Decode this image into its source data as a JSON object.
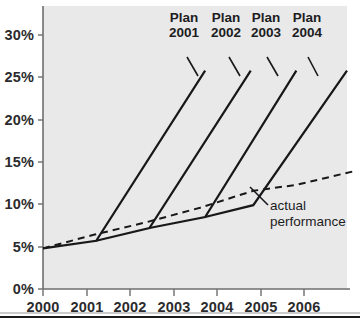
{
  "chart_data": {
    "type": "line",
    "title": "",
    "subtitle": "",
    "xlabel": "",
    "ylabel": "",
    "grid": false,
    "legend_position": "annotation",
    "x": [
      2000,
      2001,
      2002,
      2003,
      2004,
      2005,
      2006
    ],
    "x_tick_labels": [
      "2000",
      "2001",
      "2002",
      "2003",
      "2004",
      "2005",
      "2006"
    ],
    "xlim": [
      2000,
      2006
    ],
    "ylim": [
      0,
      31
    ],
    "y_tick_values": [
      0,
      5,
      10,
      15,
      20,
      25,
      30
    ],
    "y_tick_labels": [
      "0%",
      "5%",
      "10%",
      "15%",
      "20%",
      "25%",
      "30%"
    ],
    "y_unit": "%",
    "series": [
      {
        "name": "actual performance",
        "style": "dashed",
        "color": "#18181a",
        "points": [
          {
            "x": 2000.0,
            "y": 4.8
          },
          {
            "x": 2001.0,
            "y": 6.4
          },
          {
            "x": 2002.05,
            "y": 7.9
          },
          {
            "x": 2003.1,
            "y": 9.6
          },
          {
            "x": 2004.15,
            "y": 11.6
          },
          {
            "x": 2005.0,
            "y": 12.3
          },
          {
            "x": 2006.2,
            "y": 14.0
          }
        ]
      },
      {
        "name": "Plan 2001",
        "style": "solid",
        "color": "#18181a",
        "points": [
          {
            "x": 2000.0,
            "y": 4.8
          },
          {
            "x": 2001.05,
            "y": 5.7
          },
          {
            "x": 2003.2,
            "y": 25.8
          }
        ]
      },
      {
        "name": "Plan 2002",
        "style": "solid",
        "color": "#18181a",
        "points": [
          {
            "x": 2001.05,
            "y": 5.7
          },
          {
            "x": 2002.1,
            "y": 7.2
          },
          {
            "x": 2004.1,
            "y": 25.8
          }
        ]
      },
      {
        "name": "Plan 2003",
        "style": "solid",
        "color": "#18181a",
        "points": [
          {
            "x": 2002.1,
            "y": 7.2
          },
          {
            "x": 2003.2,
            "y": 8.5
          },
          {
            "x": 2005.0,
            "y": 25.8
          }
        ]
      },
      {
        "name": "Plan 2004",
        "style": "solid",
        "color": "#18181a",
        "points": [
          {
            "x": 2003.2,
            "y": 8.5
          },
          {
            "x": 2004.15,
            "y": 9.9
          },
          {
            "x": 2006.0,
            "y": 25.8
          }
        ]
      },
      {
        "name": "actual baseline tail",
        "style": "solid",
        "color": "#18181a",
        "points": [
          {
            "x": 2004.15,
            "y": 9.9
          },
          {
            "x": 2004.2,
            "y": 9.9
          }
        ]
      }
    ],
    "annotations": [
      {
        "id": "plan-2001",
        "text_line1": "Plan",
        "text_line2": "2001",
        "anchor_x": 2003.2,
        "anchor_y": 25.8
      },
      {
        "id": "plan-2002",
        "text_line1": "Plan",
        "text_line2": "2002",
        "anchor_x": 2004.1,
        "anchor_y": 25.8
      },
      {
        "id": "plan-2003",
        "text_line1": "Plan",
        "text_line2": "2003",
        "anchor_x": 2005.0,
        "anchor_y": 25.8
      },
      {
        "id": "plan-2004",
        "text_line1": "Plan",
        "text_line2": "2004",
        "anchor_x": 2006.0,
        "anchor_y": 25.8
      },
      {
        "id": "actual",
        "text_line1": "actual",
        "text_line2": "performance",
        "anchor_x": 2005.0,
        "anchor_y": 12.3
      }
    ],
    "colors": {
      "ink": "#18181a",
      "axis": "#6e6e6e",
      "plot_background": "#e9e9e9",
      "page_background": "#ffffff",
      "text": "#2b2b2d"
    }
  },
  "labels": {
    "y_ticks": [
      "30%",
      "25%",
      "20%",
      "15%",
      "10%",
      "5%",
      "0%"
    ],
    "x_ticks": [
      "2000",
      "2001",
      "2002",
      "2003",
      "2004",
      "2005",
      "2006"
    ],
    "plan_2001_line1": "Plan",
    "plan_2001_line2": "2001",
    "plan_2002_line1": "Plan",
    "plan_2002_line2": "2002",
    "plan_2003_line1": "Plan",
    "plan_2003_line2": "2003",
    "plan_2004_line1": "Plan",
    "plan_2004_line2": "2004",
    "actual_line1": "actual",
    "actual_line2": "performance"
  }
}
